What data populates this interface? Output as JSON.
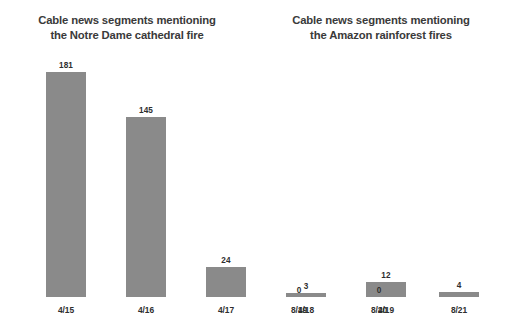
{
  "chart_data": [
    {
      "type": "bar",
      "title": "Cable news segments mentioning the Notre Dame cathedral fire",
      "title_line1": "Cable news segments mentioning",
      "title_line2": "the Notre Dame cathedral fire",
      "xlabel": "",
      "ylabel": "",
      "ylim": [
        0,
        181
      ],
      "grid": false,
      "legend": "none",
      "bar_color": "#8a8a8a",
      "categories": [
        "4/15",
        "4/16",
        "4/17",
        "4/18",
        "4/19"
      ],
      "values": [
        181,
        145,
        24,
        3,
        12
      ],
      "value_labels": [
        "181",
        "145",
        "24",
        "3",
        "12"
      ]
    },
    {
      "type": "bar",
      "title": "Cable news segments mentioning the Amazon rainforest fires",
      "title_line1": "Cable news segments mentioning",
      "title_line2": "the Amazon rainforest fires",
      "xlabel": "",
      "ylabel": "",
      "ylim": [
        0,
        181
      ],
      "grid": false,
      "legend": "none",
      "bar_color": "#8a8a8a",
      "categories": [
        "8/19",
        "8/20",
        "8/21",
        "8/22",
        "8/23"
      ],
      "values": [
        0,
        0,
        4,
        10,
        11
      ],
      "value_labels": [
        "0",
        "0",
        "4",
        "10",
        "11"
      ]
    }
  ],
  "colors": {
    "background": "#ffffff",
    "bar": "#8a8a8a",
    "title_text": "#3a3a3a",
    "label_text": "#2e2e2e"
  }
}
